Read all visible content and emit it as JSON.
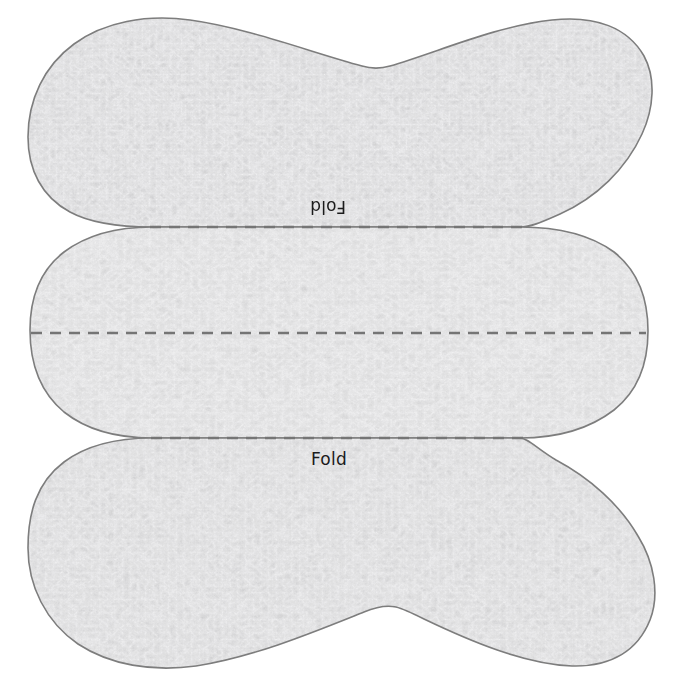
{
  "canvas": {
    "width": 674,
    "height": 686,
    "background_color": "#ffffff"
  },
  "pattern": {
    "title": "Fabric pattern template",
    "outline_color": "#7d7d7d",
    "outline_width": 1.6,
    "fill_base_color": "#e2e2e2",
    "fill_highlight_color": "#f6f6f6",
    "fill_shadow_color": "#cfcfcf",
    "texture": "mottled-fabric-noise",
    "sections": [
      {
        "name": "top-section",
        "top_y": 18,
        "bottom_y": 227,
        "left_x": 28,
        "right_x": 650
      },
      {
        "name": "middle-section",
        "top_y": 227,
        "bottom_y": 438,
        "left_x": 30,
        "right_x": 648
      },
      {
        "name": "bottom-section",
        "top_y": 438,
        "bottom_y": 668,
        "left_x": 28,
        "right_x": 650
      }
    ]
  },
  "fold_lines": [
    {
      "name": "fold-line-top",
      "y": 227,
      "x_start": 150,
      "x_end": 524,
      "color": "#757575",
      "dash": "11 8",
      "width": 2.4
    },
    {
      "name": "fold-line-middle",
      "y": 333,
      "x_start": 31,
      "x_end": 646,
      "color": "#757575",
      "dash": "11 8",
      "width": 2.4
    },
    {
      "name": "fold-line-bottom",
      "y": 438,
      "x_start": 151,
      "x_end": 523,
      "color": "#757575",
      "dash": "11 8",
      "width": 2.4
    }
  ],
  "labels": {
    "fold_top": "Fold",
    "fold_bottom": "Fold",
    "fold_top_rotation_degrees": 180,
    "fold_bottom_rotation_degrees": 0,
    "text_color": "#1b1b1b",
    "font_size_px": 17
  }
}
